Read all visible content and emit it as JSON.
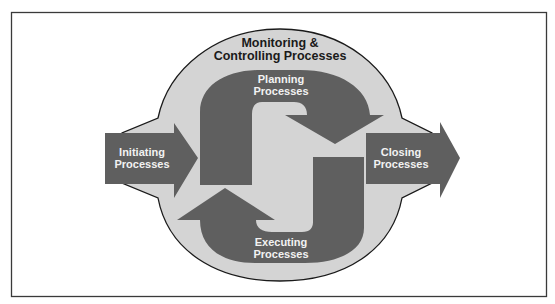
{
  "diagram": {
    "type": "process-group-cycle",
    "colors": {
      "background": "#ffffff",
      "frame_stroke": "#3a3a3a",
      "oval_fill": "#d4d4d4",
      "oval_stroke": "#1a1a1a",
      "arrow_fill": "#5f5f5f",
      "label_dark": "#1a1a1a",
      "label_light": "#f2f2f2"
    },
    "monitoring": {
      "line1": "Monitoring &",
      "line2": "Controlling Processes"
    },
    "planning": {
      "line1": "Planning",
      "line2": "Processes"
    },
    "executing": {
      "line1": "Executing",
      "line2": "Processes"
    },
    "initiating": {
      "line1": "Initiating",
      "line2": "Processes"
    },
    "closing": {
      "line1": "Closing",
      "line2": "Processes"
    }
  }
}
